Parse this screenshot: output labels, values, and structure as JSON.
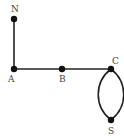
{
  "diagram": {
    "type": "graph",
    "colors": {
      "edge": "#222222",
      "node": "#111111",
      "label": "#444444",
      "background": "#ffffff"
    },
    "nodes": [
      {
        "id": "N",
        "label": "N",
        "x": 14,
        "y": 19
      },
      {
        "id": "A",
        "label": "A",
        "x": 14,
        "y": 69
      },
      {
        "id": "B",
        "label": "B",
        "x": 62,
        "y": 69
      },
      {
        "id": "C",
        "label": "C",
        "x": 111,
        "y": 69
      },
      {
        "id": "S",
        "label": "S",
        "x": 111,
        "y": 120
      }
    ],
    "edges": [
      {
        "from": "N",
        "to": "A",
        "shape": "straight"
      },
      {
        "from": "A",
        "to": "B",
        "shape": "straight"
      },
      {
        "from": "B",
        "to": "C",
        "shape": "straight"
      },
      {
        "from": "C",
        "to": "S",
        "shape": "curve-left"
      },
      {
        "from": "C",
        "to": "S",
        "shape": "curve-right"
      }
    ]
  }
}
